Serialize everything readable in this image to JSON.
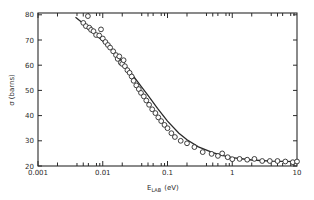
{
  "chart_data": {
    "type": "scatter",
    "title": "",
    "xlabel": "E_LAB (eV)",
    "xlabel_main": "E",
    "xlabel_sub": "LAB",
    "xlabel_unit": "(eV)",
    "ylabel": "σ (barns)",
    "xscale": "log",
    "xlim": [
      0.001,
      10
    ],
    "ylim": [
      20,
      82
    ],
    "x_ticks": [
      0.001,
      0.01,
      0.1,
      1,
      10
    ],
    "x_tick_labels": [
      "0.001",
      "0.01",
      "0.1",
      "1",
      "10"
    ],
    "y_ticks": [
      20,
      30,
      40,
      50,
      60,
      70,
      80
    ],
    "y_tick_labels": [
      "20",
      "30",
      "40",
      "50",
      "60",
      "70",
      "80"
    ],
    "grid": false,
    "legend": null,
    "series": [
      {
        "name": "measured",
        "style": "open-circles",
        "points": [
          [
            0.0059,
            79.5
          ],
          [
            0.005,
            76.8
          ],
          [
            0.0055,
            75.5
          ],
          [
            0.0062,
            74.9
          ],
          [
            0.0066,
            74.0
          ],
          [
            0.0072,
            73.5
          ],
          [
            0.0079,
            72.0
          ],
          [
            0.0088,
            71.8
          ],
          [
            0.0094,
            74.2
          ],
          [
            0.01,
            70.6
          ],
          [
            0.011,
            69.2
          ],
          [
            0.012,
            68.0
          ],
          [
            0.013,
            67.0
          ],
          [
            0.0145,
            65.5
          ],
          [
            0.016,
            64.0
          ],
          [
            0.017,
            62.5
          ],
          [
            0.018,
            63.5
          ],
          [
            0.019,
            61.0
          ],
          [
            0.02,
            60.5
          ],
          [
            0.021,
            62.0
          ],
          [
            0.022,
            59.6
          ],
          [
            0.024,
            58.0
          ],
          [
            0.026,
            57.0
          ],
          [
            0.028,
            55.5
          ],
          [
            0.03,
            53.8
          ],
          [
            0.033,
            52.0
          ],
          [
            0.036,
            50.5
          ],
          [
            0.039,
            49.0
          ],
          [
            0.043,
            47.6
          ],
          [
            0.047,
            46.0
          ],
          [
            0.052,
            44.3
          ],
          [
            0.058,
            42.5
          ],
          [
            0.065,
            41.0
          ],
          [
            0.072,
            39.3
          ],
          [
            0.08,
            37.8
          ],
          [
            0.09,
            36.3
          ],
          [
            0.1,
            35.0
          ],
          [
            0.115,
            33.0
          ],
          [
            0.13,
            31.5
          ],
          [
            0.16,
            30.0
          ],
          [
            0.2,
            29.0
          ],
          [
            0.26,
            27.5
          ],
          [
            0.35,
            25.5
          ],
          [
            0.48,
            24.8
          ],
          [
            0.6,
            24.0
          ],
          [
            0.7,
            25.0
          ],
          [
            0.85,
            23.5
          ],
          [
            1.0,
            22.7
          ],
          [
            1.3,
            22.8
          ],
          [
            1.7,
            22.5
          ],
          [
            2.2,
            22.8
          ],
          [
            2.9,
            22.0
          ],
          [
            3.8,
            22.0
          ],
          [
            5.0,
            22.0
          ],
          [
            6.6,
            21.8
          ],
          [
            8.6,
            21.5
          ],
          [
            10.0,
            21.8
          ]
        ]
      },
      {
        "name": "fit",
        "style": "solid-line",
        "points": [
          [
            0.0038,
            79.0
          ],
          [
            0.005,
            76.6
          ],
          [
            0.007,
            73.3
          ],
          [
            0.01,
            69.6
          ],
          [
            0.015,
            65.0
          ],
          [
            0.02,
            61.3
          ],
          [
            0.03,
            55.6
          ],
          [
            0.04,
            51.3
          ],
          [
            0.05,
            48.0
          ],
          [
            0.07,
            42.9
          ],
          [
            0.1,
            37.8
          ],
          [
            0.15,
            33.0
          ],
          [
            0.2,
            30.4
          ],
          [
            0.3,
            27.6
          ],
          [
            0.5,
            25.3
          ],
          [
            0.7,
            24.2
          ],
          [
            1.0,
            23.3
          ],
          [
            2.0,
            22.4
          ],
          [
            4.0,
            21.9
          ],
          [
            10.0,
            21.7
          ]
        ]
      }
    ]
  }
}
